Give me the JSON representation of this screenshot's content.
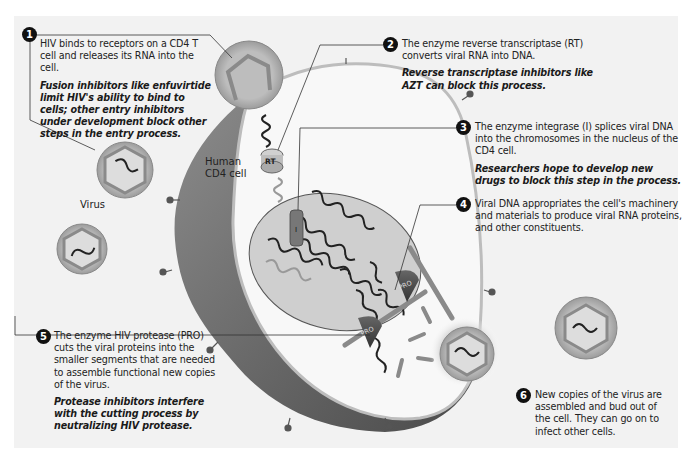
{
  "diagram": {
    "labels": {
      "virus": "Virus",
      "cell_line1": "Human",
      "cell_line2": "CD4 cell",
      "rt": "RT",
      "integrase": "I",
      "pro": "PRO"
    },
    "steps": [
      {
        "number": "1",
        "text": "HIV binds to receptors on a CD4 T cell and releases its RNA into the cell.",
        "note": "Fusion inhibitors like enfuvirtide limit HIV's ability to bind to cells; other entry inhibitors under development block other steps in the entry process."
      },
      {
        "number": "2",
        "text": "The enzyme reverse transcriptase (RT) converts viral RNA into DNA.",
        "note": "Reverse transcriptase inhibitors like AZT can block this process."
      },
      {
        "number": "3",
        "text": "The enzyme integrase (I) splices viral DNA into the chromosomes in the nucleus of the CD4 cell.",
        "note": "Researchers hope to develop new drugs to block this step in the process."
      },
      {
        "number": "4",
        "text": "Viral DNA appropriates the cell's machinery and materials to produce viral RNA proteins, and other constituents.",
        "note": ""
      },
      {
        "number": "5",
        "text": "The enzyme HIV protease (PRO) cuts the viral proteins into the smaller segments that are needed to assemble functional new copies of the virus.",
        "note": "Protease inhibitors interfere with the cutting process by neutralizing HIV protease."
      },
      {
        "number": "6",
        "text": "New copies of the virus are assembled and bud out of the cell. They can go on to infect other cells.",
        "note": ""
      }
    ],
    "colors": {
      "background": "#f2f2f2",
      "cell_wall": "#6e6e6e",
      "cytoplasm": "#f8f8f8",
      "nucleus": "#cfcfcf",
      "virus_shell": "#b5b5b5",
      "capsid": "#8a8a8a",
      "enzyme": "#555555"
    }
  }
}
